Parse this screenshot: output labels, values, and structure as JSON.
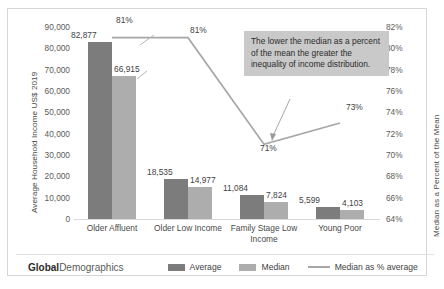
{
  "brand": {
    "bold": "Global",
    "light": "Demographics"
  },
  "annotation": "The lower the median as a percent of the mean the greater the inequality of income distribution.",
  "legend": {
    "average": "Average",
    "median": "Median",
    "line": "Median as % average"
  },
  "colors": {
    "average_bar": "#7c7c7c",
    "median_bar": "#adadad",
    "line": "#a6a6a6",
    "annotation_bg": "#c9c9c9",
    "frame_border": "#d6d6d6"
  },
  "chart_data": {
    "type": "bar",
    "title": "",
    "categories": [
      "Older Affluent",
      "Older Low Income",
      "Family Stage Low Income",
      "Young Poor"
    ],
    "series": [
      {
        "name": "Average",
        "values": [
          82877,
          18535,
          11084,
          5599
        ],
        "labels": [
          "82,877",
          "18,535",
          "11,084",
          "5,599"
        ]
      },
      {
        "name": "Median",
        "values": [
          66915,
          14977,
          7824,
          4103
        ],
        "labels": [
          "66,915",
          "14,977",
          "7,824",
          "4,103"
        ]
      },
      {
        "name": "Median as % average",
        "values": [
          81,
          81,
          71,
          73
        ],
        "labels": [
          "81%",
          "81%",
          "71%",
          "73%"
        ],
        "axis": "right",
        "type": "line"
      }
    ],
    "xlabel": "",
    "ylabel": "Average Household Income US$ 2019",
    "ylabel_right": "Median as a Percent of the Mean",
    "ylim": [
      0,
      90000
    ],
    "yticks": [
      "0",
      "10,000",
      "20,000",
      "30,000",
      "40,000",
      "50,000",
      "60,000",
      "70,000",
      "80,000",
      "90,000"
    ],
    "ylim_right": [
      64,
      82
    ],
    "yticks_right": [
      "64%",
      "66%",
      "68%",
      "70%",
      "72%",
      "74%",
      "76%",
      "78%",
      "80%",
      "82%"
    ],
    "grid": false,
    "legend_position": "bottom"
  }
}
